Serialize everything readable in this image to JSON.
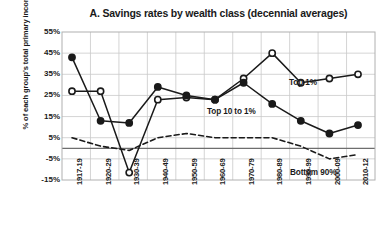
{
  "chart_data": {
    "type": "line",
    "title": "A. Savings rates by wealth class (decennial averages)",
    "xlabel": "",
    "ylabel": "% of each group's total primary income",
    "categories": [
      "1917-19",
      "1920-29",
      "1930-39",
      "1940-49",
      "1950-59",
      "1960-69",
      "1970-79",
      "1980-89",
      "1990-99",
      "2000-09",
      "2010-12"
    ],
    "ylim": [
      -15,
      55
    ],
    "yticks": [
      55,
      45,
      35,
      25,
      15,
      5,
      -5,
      -15
    ],
    "ytick_labels": [
      "55%",
      "45%",
      "35%",
      "25%",
      "15%",
      "5%",
      "-5%",
      "-15%"
    ],
    "grid": true,
    "legend_position": "inline-annotations",
    "series": [
      {
        "name": "Top 1%",
        "marker": "open-circle",
        "line_style": "solid",
        "color": "#1a1a1a",
        "label_x": 289,
        "label_y": 78,
        "values": [
          27,
          27,
          -11.5,
          23,
          24,
          23,
          33,
          45,
          31,
          33,
          35
        ]
      },
      {
        "name": "Top 10 to 1%",
        "marker": "filled-circle",
        "line_style": "solid",
        "color": "#1a1a1a",
        "label_x": 207,
        "label_y": 107,
        "values": [
          43,
          13,
          12,
          29,
          25,
          23,
          31,
          21,
          13,
          7,
          11
        ]
      },
      {
        "name": "Bottom 90%",
        "marker": "none",
        "line_style": "dashed",
        "color": "#1a1a1a",
        "label_x": 290,
        "label_y": 168,
        "values": [
          5,
          1,
          -1,
          5,
          7,
          5,
          5,
          5,
          1,
          -5,
          -3
        ]
      }
    ]
  }
}
